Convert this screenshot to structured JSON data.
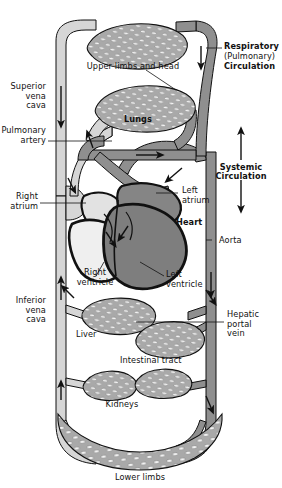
{
  "colors": {
    "deoxygenated_vessel": "#d4d4d4",
    "oxygenated_vessel": "#8a8a8a",
    "heart_left_dark": "#808080",
    "heart_right_light": "#e0e0e0",
    "capillary_fill": "#a8a8a8",
    "capillary_lumen": "#f2f2f2",
    "outline": "#000000",
    "text": "#111111",
    "background": "#ffffff"
  },
  "labels": {
    "upper_limbs_and_head": "Upper limbs and head",
    "lungs": "Lungs",
    "heart": "Heart",
    "liver": "Liver",
    "intestinal_tract": "Intestinal tract",
    "kidneys": "Kidneys",
    "lower_limbs": "Lower limbs",
    "superior_vena_cava": "Superior\nvena\ncava",
    "pulmonary_artery": "Pulmonary\nartery",
    "right_atrium": "Right\natrium",
    "inferior_vena_cava": "Inferior\nvena\ncava",
    "right_ventricle": "Right\nventricle",
    "left_atrium": "Left\natrium",
    "left_ventricle": "Left\nventricle",
    "aorta": "Aorta",
    "hepatic_portal_vein": "Hepatic\nportal\nvein",
    "respiratory_line1": "Respiratory",
    "respiratory_line2": "(Pulmonary)",
    "respiratory_line3": "Circulation",
    "systemic_line1": "Systemic",
    "systemic_line2": "Circulation"
  },
  "annotations": {
    "flow_arrows": [
      {
        "name": "superior-vena-cava-down",
        "direction": "down"
      },
      {
        "name": "pulmonary-artery-up",
        "direction": "up"
      },
      {
        "name": "pulmonary-vein-right",
        "direction": "right"
      },
      {
        "name": "aorta-down",
        "direction": "down"
      },
      {
        "name": "inferior-vena-cava-up",
        "direction": "up"
      },
      {
        "name": "upper-limbs-return",
        "direction": "down"
      },
      {
        "name": "systemic-arrow-up",
        "direction": "up"
      },
      {
        "name": "systemic-arrow-down",
        "direction": "down"
      }
    ]
  },
  "diagram_data": {
    "type": "anatomical-schematic",
    "circuits": [
      {
        "name": "Respiratory (Pulmonary) Circulation",
        "organs": [
          "Lungs"
        ]
      },
      {
        "name": "Systemic Circulation",
        "organs": [
          "Upper limbs and head",
          "Liver",
          "Intestinal tract",
          "Kidneys",
          "Lower limbs"
        ]
      }
    ],
    "heart_chambers": [
      "Right atrium",
      "Right ventricle",
      "Left atrium",
      "Left ventricle"
    ],
    "major_vessels": [
      "Superior vena cava",
      "Inferior vena cava",
      "Pulmonary artery",
      "Aorta",
      "Hepatic portal vein"
    ]
  }
}
